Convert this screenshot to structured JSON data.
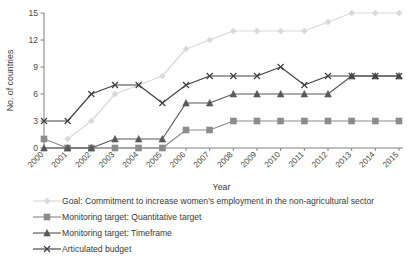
{
  "chart_data": {
    "type": "line",
    "title": "",
    "xlabel": "Year",
    "ylabel": "No. of countries",
    "categories": [
      "2000",
      "2001",
      "2002",
      "2003",
      "2004",
      "2005",
      "2006",
      "2007",
      "2008",
      "2009",
      "2010",
      "2011",
      "2012",
      "2013",
      "2014",
      "2015"
    ],
    "x": [
      2000,
      2001,
      2002,
      2003,
      2004,
      2005,
      2006,
      2007,
      2008,
      2009,
      2010,
      2011,
      2012,
      2013,
      2014,
      2015
    ],
    "ylim": [
      0,
      15
    ],
    "xticklabels": [
      "2000",
      "2001",
      "2002",
      "2003",
      "2004",
      "2005",
      "2006",
      "2007",
      "2008",
      "2009",
      "2010",
      "2011",
      "2012",
      "2013",
      "2014",
      "2015"
    ],
    "yticklabels": [
      "0",
      "3",
      "6",
      "9",
      "12",
      "15"
    ],
    "yticks": [
      0,
      3,
      6,
      9,
      12,
      15
    ],
    "grid": false,
    "legend_position": "below",
    "series": [
      {
        "name": "Goal: Commitment to increase women's employment in the non-agricultural sector",
        "marker": "diamond",
        "color": "#d9d9d9",
        "values": [
          null,
          1,
          3,
          6,
          7,
          8,
          11,
          12,
          13,
          13,
          13,
          13,
          14,
          15,
          15,
          15
        ]
      },
      {
        "name": "Monitoring target: Quantitative target",
        "marker": "square",
        "color": "#8c8c8c",
        "values": [
          1,
          0,
          0,
          0,
          0,
          0,
          2,
          2,
          3,
          3,
          3,
          3,
          3,
          3,
          3,
          3
        ]
      },
      {
        "name": "Monitoring target: Timeframe",
        "marker": "triangle",
        "color": "#595959",
        "values": [
          0,
          0,
          0,
          1,
          1,
          1,
          5,
          5,
          6,
          6,
          6,
          6,
          6,
          8,
          8,
          8
        ]
      },
      {
        "name": "Articulated budget",
        "marker": "cross",
        "color": "#404040",
        "values": [
          3,
          3,
          6,
          7,
          7,
          5,
          7,
          8,
          8,
          8,
          9,
          7,
          8,
          8,
          8,
          8
        ]
      }
    ]
  },
  "axes": {
    "y_title": "No. of countries",
    "x_title": "Year"
  },
  "legend": {
    "items": [
      {
        "label": "Goal: Commitment to increase women's employment in the non-agricultural sector"
      },
      {
        "label": "Monitoring target: Quantitative target"
      },
      {
        "label": "Monitoring target: Timeframe"
      },
      {
        "label": "Articulated budget"
      }
    ]
  }
}
